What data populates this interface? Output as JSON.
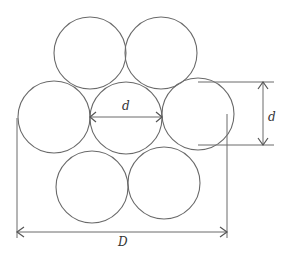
{
  "diagram": {
    "type": "seven-strand circle packing cross-section",
    "circle_radius": 36,
    "circles": [
      {
        "id": "top-left",
        "cx": 90,
        "cy": 53
      },
      {
        "id": "top-right",
        "cx": 161,
        "cy": 53
      },
      {
        "id": "middle-left",
        "cx": 54,
        "cy": 117
      },
      {
        "id": "middle-center",
        "cx": 126,
        "cy": 118
      },
      {
        "id": "middle-right",
        "cx": 198,
        "cy": 114
      },
      {
        "id": "bottom-left",
        "cx": 92,
        "cy": 187
      },
      {
        "id": "bottom-right",
        "cx": 164,
        "cy": 183
      }
    ],
    "labels": {
      "inner_diameter": "d",
      "side_diameter": "d",
      "overall_diameter": "D"
    }
  }
}
